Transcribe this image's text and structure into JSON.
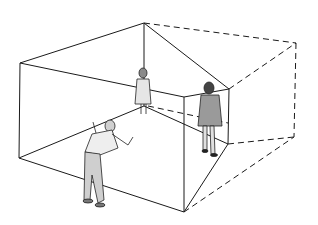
{
  "colors": {
    "line": "#1a1a1a",
    "figure_fill": "#d9d9d9",
    "figure_dark": "#555555",
    "background": "#ffffff"
  },
  "room": {
    "solid_vertices": {
      "top_left": [
        20,
        63
      ],
      "top_back": [
        144,
        23
      ],
      "top_front": [
        184,
        97
      ],
      "top_right": [
        229,
        89
      ],
      "bottom_left": [
        19,
        158
      ],
      "bottom_back": [
        148,
        106
      ],
      "bottom_front": [
        184,
        212
      ],
      "bottom_right": [
        228,
        144
      ]
    },
    "dashed_vertices": {
      "top_far": [
        296,
        43
      ],
      "bottom_far": [
        294,
        137
      ]
    }
  },
  "figures": [
    {
      "name": "small-girl",
      "position": "back-corner"
    },
    {
      "name": "tall-man",
      "position": "right-corner"
    },
    {
      "name": "observer",
      "position": "foreground"
    }
  ]
}
